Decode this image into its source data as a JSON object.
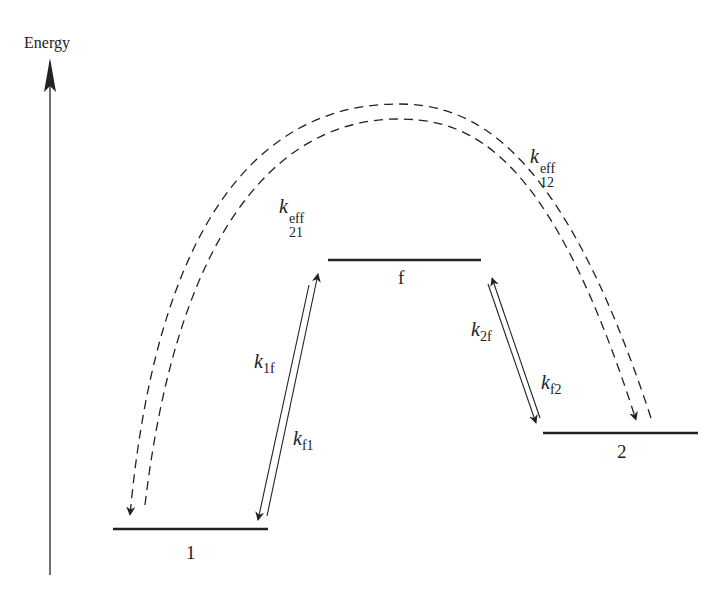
{
  "diagram": {
    "axis": {
      "label": "Energy"
    },
    "levels": [
      {
        "id": "1",
        "label": "1"
      },
      {
        "id": "f",
        "label": "f"
      },
      {
        "id": "2",
        "label": "2"
      }
    ],
    "rates": {
      "k1f": {
        "symbol": "k",
        "sub": "1f"
      },
      "kf1": {
        "symbol": "k",
        "sub": "f1"
      },
      "k2f": {
        "symbol": "k",
        "sub": "2f"
      },
      "kf2": {
        "symbol": "k",
        "sub": "f2"
      },
      "k21eff": {
        "symbol": "k",
        "sub": "21",
        "sup": "eff"
      },
      "k12eff": {
        "symbol": "k",
        "sub": "12",
        "sup": "eff"
      }
    },
    "colors": {
      "line": "#222222",
      "background": "#ffffff"
    }
  }
}
